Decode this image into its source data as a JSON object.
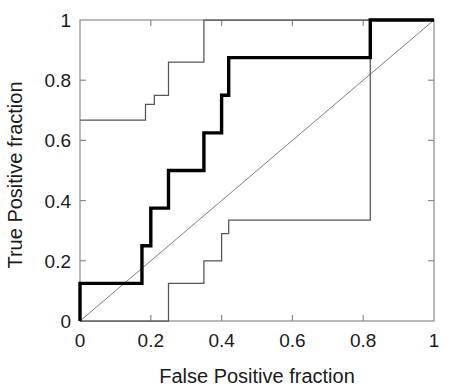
{
  "chart_data": {
    "type": "line",
    "title": "",
    "xlabel": "False Positive fraction",
    "ylabel": "True Positive fraction",
    "xlim": [
      0,
      1
    ],
    "ylim": [
      0,
      1
    ],
    "grid": false,
    "legend": null,
    "xticks": [
      0,
      0.2,
      0.4,
      0.6,
      0.8,
      1
    ],
    "yticks": [
      0,
      0.2,
      0.4,
      0.6,
      0.8,
      1
    ],
    "xtick_labels": [
      "0",
      "0.2",
      "0.4",
      "0.6",
      "0.8",
      "1"
    ],
    "ytick_labels": [
      "0",
      "0.2",
      "0.4",
      "0.6",
      "0.8",
      "1"
    ],
    "series": [
      {
        "name": "ROC curve",
        "style": "step",
        "linewidth": "thick",
        "color": "#000000",
        "x": [
          0,
          0,
          0.175,
          0.175,
          0.2,
          0.2,
          0.25,
          0.25,
          0.35,
          0.35,
          0.4,
          0.4,
          0.42,
          0.42,
          0.82,
          0.82,
          1.0
        ],
        "y": [
          0,
          0.125,
          0.125,
          0.25,
          0.25,
          0.375,
          0.375,
          0.5,
          0.5,
          0.625,
          0.625,
          0.75,
          0.75,
          0.875,
          0.875,
          1.0,
          1.0
        ]
      },
      {
        "name": "Upper confidence bound",
        "style": "step",
        "linewidth": "thin",
        "color": "#555555",
        "x": [
          0,
          0.185,
          0.185,
          0.21,
          0.21,
          0.25,
          0.25,
          0.35,
          0.35,
          1.0
        ],
        "y": [
          0.667,
          0.667,
          0.72,
          0.72,
          0.75,
          0.75,
          0.86,
          0.86,
          1.0,
          1.0
        ]
      },
      {
        "name": "Lower confidence bound",
        "style": "step",
        "linewidth": "thin",
        "color": "#555555",
        "x": [
          0,
          0.25,
          0.25,
          0.35,
          0.35,
          0.4,
          0.4,
          0.42,
          0.42,
          0.82,
          0.82,
          1.0
        ],
        "y": [
          0,
          0,
          0.125,
          0.125,
          0.2,
          0.2,
          0.29,
          0.29,
          0.335,
          0.335,
          1.0,
          1.0
        ]
      },
      {
        "name": "Chance diagonal",
        "style": "line",
        "linewidth": "hairline",
        "color": "#707070",
        "x": [
          0,
          1
        ],
        "y": [
          0,
          1
        ]
      }
    ]
  }
}
